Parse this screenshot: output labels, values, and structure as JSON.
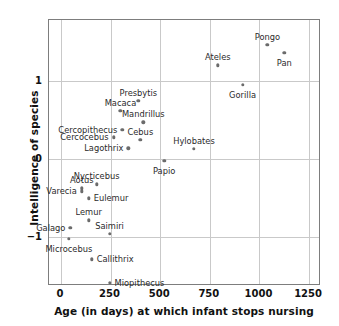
{
  "chart_data": {
    "type": "scatter",
    "title": "",
    "xlabel": "Age (in days) at which infant stops nursing",
    "ylabel": "Intelligence of species",
    "xlim": [
      -60,
      1310
    ],
    "ylim": [
      -1.62,
      1.78
    ],
    "xticks": [
      0,
      250,
      500,
      750,
      1000,
      1250
    ],
    "xtick_labels": [
      "0",
      "250",
      "500",
      "750",
      "1000",
      "1250"
    ],
    "yticks": [
      1,
      0,
      -1
    ],
    "ytick_labels": [
      "1",
      "0",
      "−1"
    ],
    "grid": true,
    "legend": "none",
    "marker_color": "#6b6b6b",
    "frame_color": "#7d7d7d",
    "grid_color": "#c9c9c9",
    "points": [
      {
        "label": "Pongo",
        "x": 1040,
        "y": 1.46,
        "pos": "above"
      },
      {
        "label": "Pan",
        "x": 1125,
        "y": 1.36,
        "pos": "below"
      },
      {
        "label": "Ateles",
        "x": 790,
        "y": 1.2,
        "pos": "above"
      },
      {
        "label": "Gorilla",
        "x": 915,
        "y": 0.95,
        "pos": "below"
      },
      {
        "label": "Presbytis",
        "x": 390,
        "y": 0.75,
        "pos": "above"
      },
      {
        "label": "Macaca",
        "x": 300,
        "y": 0.62,
        "pos": "above"
      },
      {
        "label": "Mandrillus",
        "x": 415,
        "y": 0.47,
        "pos": "above"
      },
      {
        "label": "Cercopithecus",
        "x": 310,
        "y": 0.38,
        "pos": "left"
      },
      {
        "label": "Cercocebus",
        "x": 265,
        "y": 0.28,
        "pos": "left"
      },
      {
        "label": "Cebus",
        "x": 400,
        "y": 0.25,
        "pos": "above"
      },
      {
        "label": "Lagothrix",
        "x": 340,
        "y": 0.14,
        "pos": "left"
      },
      {
        "label": "Hylobates",
        "x": 670,
        "y": 0.13,
        "pos": "above"
      },
      {
        "label": "Papio",
        "x": 520,
        "y": -0.02,
        "pos": "below"
      },
      {
        "label": "Nycticebus",
        "x": 180,
        "y": -0.32,
        "pos": "above"
      },
      {
        "label": "Aotus",
        "x": 105,
        "y": -0.37,
        "pos": "above"
      },
      {
        "label": "Varecia",
        "x": 105,
        "y": -0.41,
        "pos": "left"
      },
      {
        "label": "Eulemur",
        "x": 140,
        "y": -0.5,
        "pos": "right"
      },
      {
        "label": "Lemur",
        "x": 140,
        "y": -0.78,
        "pos": "above"
      },
      {
        "label": "Galago",
        "x": 48,
        "y": -0.88,
        "pos": "left"
      },
      {
        "label": "Saimiri",
        "x": 245,
        "y": -0.95,
        "pos": "above"
      },
      {
        "label": "Microcebus",
        "x": 40,
        "y": -1.02,
        "pos": "below"
      },
      {
        "label": "Callithrix",
        "x": 155,
        "y": -1.28,
        "pos": "right"
      },
      {
        "label": "Miopithecus",
        "x": 245,
        "y": -1.58,
        "pos": "right"
      }
    ]
  }
}
